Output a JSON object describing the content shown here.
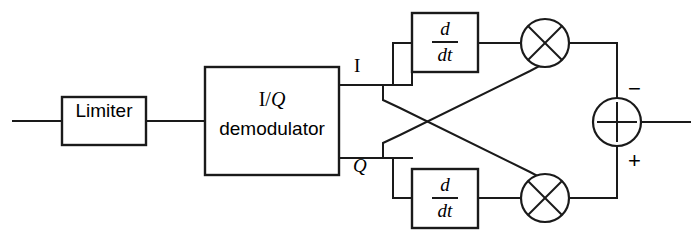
{
  "diagram": {
    "colors": {
      "line": "#1a1a1a",
      "background": "#ffffff",
      "text": "#000000"
    },
    "blocks": {
      "limiter": {
        "label": "Limiter"
      },
      "demodulator": {
        "label_line1_i": "I",
        "label_line1_sep": "/",
        "label_line1_q": "Q",
        "label_line2": "demodulator"
      },
      "differentiator_top": {
        "numerator": "d",
        "denominator": "dt"
      },
      "differentiator_bottom": {
        "numerator": "d",
        "denominator": "dt"
      },
      "multiplier_top": {
        "symbol": "×"
      },
      "multiplier_bottom": {
        "symbol": "×"
      },
      "summer": {
        "symbol": "+",
        "input_top_sign": "−",
        "input_bottom_sign": "+"
      }
    },
    "signals": {
      "i_branch_label": "I",
      "q_branch_label": "Q"
    }
  }
}
